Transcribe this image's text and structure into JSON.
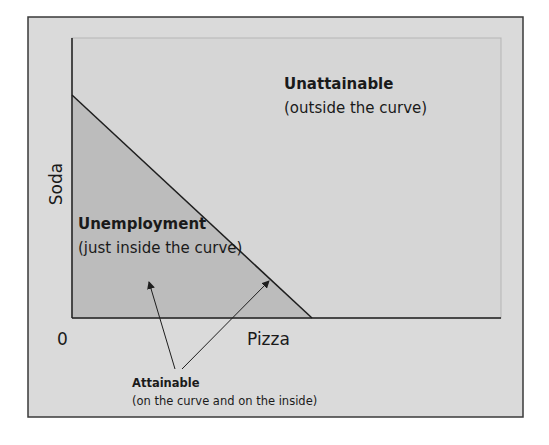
{
  "figure": {
    "type": "production-possibilities-frontier",
    "colors": {
      "frame_fill": "#dadada",
      "frame_border": "#3a3a3a",
      "unattainable_fill": "#d6d6d6",
      "plot_border": "#b5b5b5",
      "attainable_fill": "#bcbcbc",
      "line": "#1e1e1e",
      "text": "#1a1a1a"
    }
  },
  "axes": {
    "x_label": "Pizza",
    "y_label": "Soda",
    "origin_label": "0"
  },
  "regions": {
    "unattainable": {
      "title": "Unattainable",
      "subtitle": "(outside the curve)"
    },
    "unemployment": {
      "title": "Unemployment",
      "subtitle": "(just inside the curve)"
    },
    "attainable": {
      "title": "Attainable",
      "subtitle": "(on the curve and on the inside)"
    }
  },
  "curve": {
    "shape": "straight-line",
    "y_intercept_px": [
      72,
      95
    ],
    "x_intercept_px": [
      312,
      318
    ]
  },
  "annotations": {
    "arrows": [
      {
        "from": [
          175,
          369
        ],
        "to": [
          149,
          281
        ],
        "target": "inside-the-curve"
      },
      {
        "from": [
          182,
          369
        ],
        "to": [
          270,
          280
        ],
        "target": "on-the-curve"
      }
    ]
  }
}
